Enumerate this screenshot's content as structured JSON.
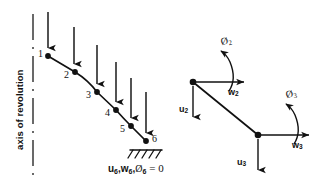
{
  "figure": {
    "type": "engineering-diagram",
    "background_color": "#ffffff",
    "ink_color": "#111111"
  },
  "left_panel": {
    "axis_label": "axis of revolution",
    "axis_line_style": "dash-dot vertical",
    "node_numbers": [
      "1",
      "2",
      "3",
      "4",
      "5",
      "6"
    ],
    "load_arrows_count": 6,
    "load_direction": "downward",
    "support": {
      "type": "fixed-hatched",
      "at_node": "6"
    },
    "boundary_condition": {
      "u": "u",
      "u_sub": "6",
      "w": "w",
      "w_sub": "6",
      "phi": "Ø",
      "phi_sub": "6",
      "equals": "= 0",
      "full_text": "u6,w6,Ø6 = 0"
    }
  },
  "right_panel": {
    "caption": "element nodal degrees of freedom",
    "nodes": [
      {
        "id": "node-2",
        "dofs": [
          {
            "name": "u",
            "sub": "2",
            "kind": "translation",
            "direction": "down"
          },
          {
            "name": "w",
            "sub": "2",
            "kind": "translation",
            "direction": "right"
          },
          {
            "name": "Ø",
            "sub": "2",
            "kind": "rotation",
            "direction": "counterclockwise"
          }
        ]
      },
      {
        "id": "node-3",
        "dofs": [
          {
            "name": "u",
            "sub": "3",
            "kind": "translation",
            "direction": "down"
          },
          {
            "name": "w",
            "sub": "3",
            "kind": "translation",
            "direction": "right"
          },
          {
            "name": "Ø",
            "sub": "3",
            "kind": "rotation",
            "direction": "counterclockwise"
          }
        ]
      }
    ]
  },
  "labels": {
    "axis_of_revolution": "axis of revolution",
    "n1": "1",
    "n2": "2",
    "n3": "3",
    "n4": "4",
    "n5": "5",
    "n6": "6",
    "u2": "u",
    "u2_sub": "2",
    "w2": "w",
    "w2_sub": "2",
    "phi2": "Ø",
    "phi2_sub": "2",
    "u3": "u",
    "u3_sub": "3",
    "w3": "w",
    "w3_sub": "3",
    "phi3": "Ø",
    "phi3_sub": "3",
    "bc_u": "u",
    "bc_u_sub": "6",
    "bc_sep1": ",",
    "bc_w": "w",
    "bc_w_sub": "6",
    "bc_sep2": ",",
    "bc_phi": "Ø",
    "bc_phi_sub": "6",
    "bc_eq": "= 0"
  }
}
